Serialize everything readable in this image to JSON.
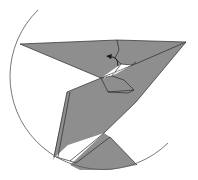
{
  "diagram": {
    "type": "origami-step",
    "colors": {
      "paper": "#8e8e8e",
      "paper_light": "#9a9a9a",
      "line": "#2a2a2a",
      "circle": "#555555",
      "background": "#ffffff"
    },
    "annotations": [
      {
        "kind": "fold-arrow",
        "meaning": "fold flap up"
      }
    ]
  }
}
